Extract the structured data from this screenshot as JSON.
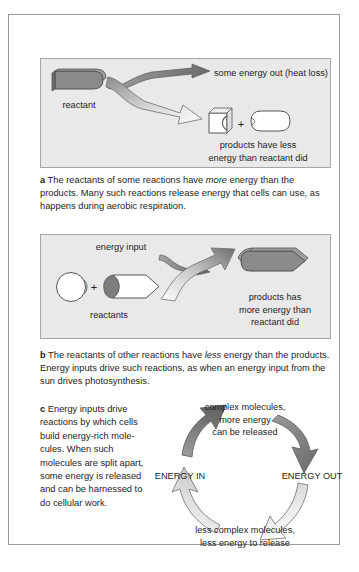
{
  "figure": {
    "panels": [
      {
        "key": "a",
        "letter": "a",
        "caption_parts": {
          "lead": "The reactants of some reactions have ",
          "emphasis": "more",
          "rest": " energy than the products. Many such reactions release energy that cells can use, as happens during aerobic respiration."
        },
        "diagram": {
          "reactant_label": "reactant",
          "energy_out_label": "some energy out (heat loss)",
          "product_a_label": "A",
          "plus_symbol": "+",
          "product_b_label": "B",
          "products_note": "products have less\nenergy than reactant did",
          "products_note_line1": "products have less",
          "products_note_line2": "energy than reactant did"
        }
      },
      {
        "key": "b",
        "letter": "b",
        "caption_parts": {
          "lead": "The reactants of other reactions have ",
          "emphasis": "less",
          "rest": " energy than the products. Energy inputs drive such reactions, as when an energy input from the sun drives photosynthesis."
        },
        "diagram": {
          "energy_input_label": "energy input",
          "reactant_c_label": "C",
          "plus_symbol": "+",
          "reactant_d_label": "D",
          "reactants_label": "reactants",
          "products_note_line1": "products has",
          "products_note_line2": "more energy than",
          "products_note_line3": "reactant did"
        }
      },
      {
        "key": "c",
        "letter": "c",
        "caption_text": "Energy inputs drive reactions by which cells build energy-rich mole-cules. When such molecules are split apart, some energy is released and can be harnessed to do cellular work.",
        "cycle": {
          "top_line1": "complex molecules,",
          "top_line2": "more energy",
          "top_line3": "can be released",
          "bottom_line1": "less complex molecules,",
          "bottom_line2": "less energy to release",
          "left_label": "ENERGY IN",
          "right_label": "ENERGY OUT"
        }
      }
    ]
  },
  "colors": {
    "panel_background": "#e9e9e9",
    "panel_border": "#a6a6a6",
    "page_border": "#9a9a9a",
    "dark_shape": "#8a8a8a",
    "dark_shape_edge": "#5d5d5d",
    "light_shape": "#ffffff",
    "text": "#1d1d1d",
    "arrow_dark": "#7c7c7c",
    "arrow_light": "#f2f2f2"
  }
}
